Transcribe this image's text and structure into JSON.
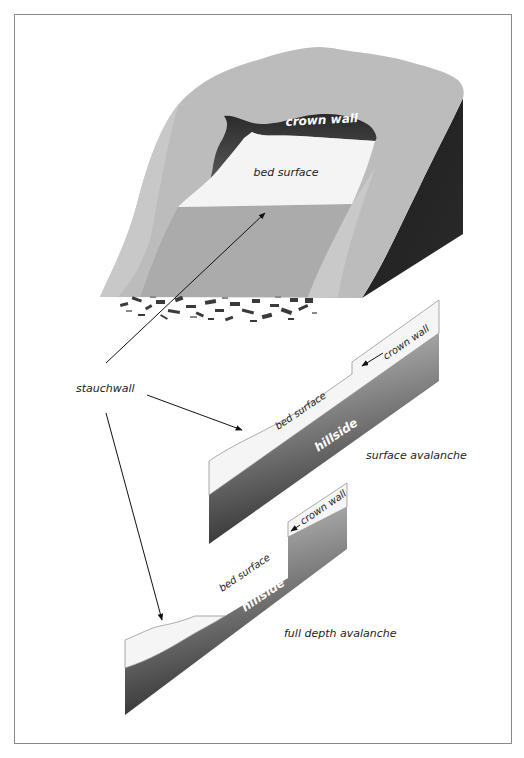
{
  "diagram": {
    "labels": {
      "mountain_crown_wall": "crown wall",
      "mountain_bed_surface": "bed surface",
      "stauchwall": "stauchwall",
      "surface": {
        "crown_wall": "crown wall",
        "bed_surface": "bed surface",
        "hillside": "hillside",
        "caption": "surface avalanche"
      },
      "full_depth": {
        "crown_wall": "crown wall",
        "bed_surface": "bed surface",
        "hillside": "hillside",
        "caption": "full depth avalanche"
      }
    },
    "colors": {
      "snow_slope": "#bcbcbc",
      "slide_path": "#ababab",
      "bed_surface": "#f4f4f4",
      "crown_wall": "#3a3a3a",
      "cliff_face": "#222222",
      "hillside_light": "#cfcfcf",
      "hillside_dark": "#333333",
      "frame": "#8a8a8a"
    }
  }
}
